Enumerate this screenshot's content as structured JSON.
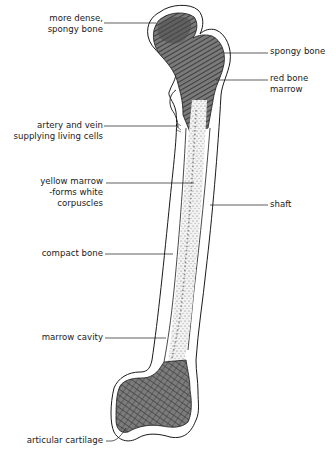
{
  "diagram": {
    "colors": {
      "outline": "#1a1a1a",
      "spongy_fill": "#6a6a6a",
      "spongy_hatch": "#2a2a2a",
      "marrow_stipple": "#8a8a8a",
      "background": "#ffffff"
    },
    "labels": {
      "more_dense_spongy_bone": {
        "line1": "more dense,",
        "line2": "spongy bone"
      },
      "spongy_bone": {
        "line1": "spongy bone"
      },
      "red_bone_marrow": {
        "line1": "red bone",
        "line2": "marrow"
      },
      "artery_and_vein": {
        "line1": "artery and vein",
        "line2": "supplying living cells"
      },
      "yellow_marrow": {
        "line1": "yellow marrow",
        "line2": "-forms white",
        "line3": "corpuscles"
      },
      "shaft": {
        "line1": "shaft"
      },
      "compact_bone": {
        "line1": "compact bone"
      },
      "marrow_cavity": {
        "line1": "marrow cavity"
      },
      "articular_cartilage": {
        "line1": "articular cartilage"
      }
    }
  }
}
